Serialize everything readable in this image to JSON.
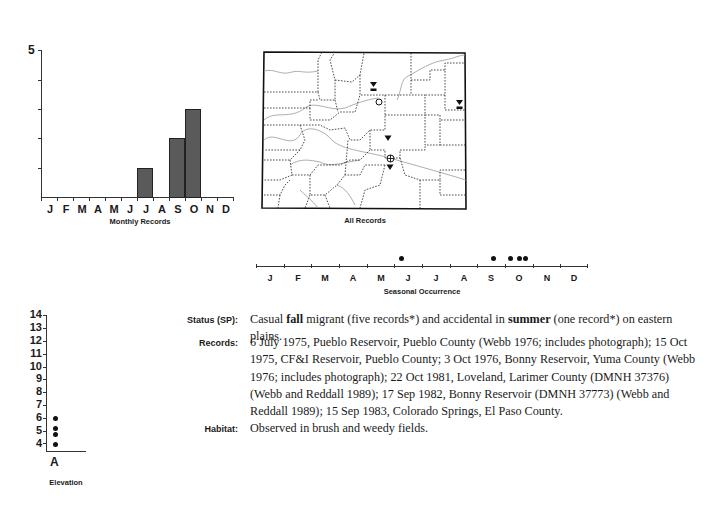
{
  "monthly_chart": {
    "caption": "Monthly Records",
    "y_top_label": "5",
    "months": [
      "J",
      "F",
      "M",
      "A",
      "M",
      "J",
      "J",
      "A",
      "S",
      "O",
      "N",
      "D"
    ]
  },
  "map": {
    "caption": "All Records",
    "markers": [
      {
        "type": "triangle-photo",
        "x": 373,
        "y": 87
      },
      {
        "type": "open-circle",
        "x": 379,
        "y": 102
      },
      {
        "type": "triangle-photo",
        "x": 459,
        "y": 105
      },
      {
        "type": "triangle",
        "x": 388,
        "y": 139
      },
      {
        "type": "circle-cross",
        "x": 390,
        "y": 158
      },
      {
        "type": "triangle",
        "x": 390,
        "y": 167
      }
    ]
  },
  "seasonal_chart": {
    "caption": "Seasonal Occurrence",
    "months": [
      "J",
      "F",
      "M",
      "A",
      "M",
      "J",
      "J",
      "A",
      "S",
      "O",
      "N",
      "D"
    ]
  },
  "elevation_chart": {
    "caption": "Elevation",
    "y_labels": [
      "14",
      "13",
      "12",
      "11",
      "10",
      "9",
      "8",
      "7",
      "6",
      "5",
      "4"
    ],
    "x_label": "A"
  },
  "account": {
    "status_label": "Status (SP):",
    "status_pre": "Casual ",
    "status_b1": "fall",
    "status_mid": " migrant (five records*) and accidental in ",
    "status_b2": "summer",
    "status_post": " (one record*) on eastern plains.",
    "records_label": "Records:",
    "records_text": "6 July 1975, Pueblo Reservoir, Pueblo County (Webb 1976; includes photograph); 15 Oct 1975, CF&I Reservoir, Pueblo County; 3 Oct 1976, Bonny Reservoir, Yuma County (Webb 1976; includes photograph); 22 Oct 1981, Loveland, Larimer County (DMNH 37376) (Webb and Reddall 1989); 17 Sep 1982, Bonny Reservoir (DMNH 37773) (Webb and Reddall 1989); 15 Sep 1983, Colorado Springs, El Paso County.",
    "habitat_label": "Habitat:",
    "habitat_text": "Observed in brush and weedy fields."
  },
  "chart_data": [
    {
      "type": "bar",
      "title": "Monthly Records",
      "categories": [
        "J",
        "F",
        "M",
        "A",
        "M",
        "J",
        "J",
        "A",
        "S",
        "O",
        "N",
        "D"
      ],
      "values": [
        0,
        0,
        0,
        0,
        0,
        0,
        1,
        0,
        2,
        3,
        0,
        0
      ],
      "xlabel": "Monthly Records",
      "ylabel": "",
      "ylim": [
        0,
        5
      ],
      "yticks": [
        1,
        2,
        3,
        4,
        5
      ],
      "grid": false
    },
    {
      "type": "scatter",
      "title": "Seasonal Occurrence",
      "categories": [
        "J",
        "F",
        "M",
        "A",
        "M",
        "J",
        "J",
        "A",
        "S",
        "O",
        "N",
        "D"
      ],
      "points": [
        {
          "date": "6 Jul",
          "x_month": 7.2
        },
        {
          "date": "15 Sep",
          "x_month": 9.5
        },
        {
          "date": "17 Sep",
          "x_month": 9.55
        },
        {
          "date": "3 Oct",
          "x_month": 10.1
        },
        {
          "date": "15 Oct",
          "x_month": 10.5
        },
        {
          "date": "22 Oct",
          "x_month": 10.7
        }
      ],
      "xlabel": "Seasonal Occurrence"
    },
    {
      "type": "scatter",
      "title": "Elevation",
      "categories": [
        "A"
      ],
      "y_values_thousand_ft": [
        6.0,
        5.2,
        4.7,
        3.9
      ],
      "ylim": [
        4,
        14
      ],
      "xlabel": "Elevation",
      "ylabel": ""
    }
  ]
}
